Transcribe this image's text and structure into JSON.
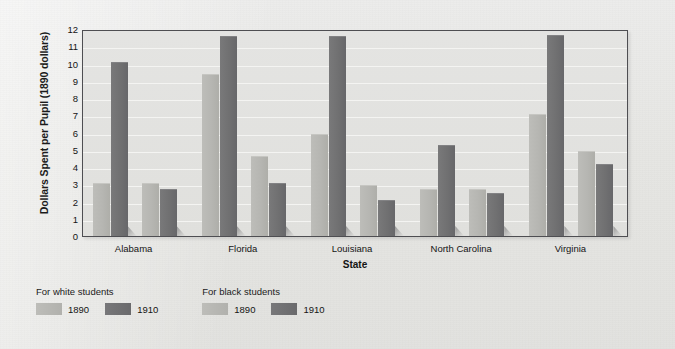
{
  "chart_data": {
    "type": "bar",
    "title": "",
    "xlabel": "State",
    "ylabel": "Dollars Spent per Pupil (1890 dollars)",
    "categories": [
      "Alabama",
      "Florida",
      "Louisiana",
      "North Carolina",
      "Virginia"
    ],
    "series": [
      {
        "name": "For white students 1890",
        "group": "For white students",
        "year": "1890",
        "color": "#b5b5b1",
        "values": [
          3.1,
          9.4,
          5.9,
          2.75,
          7.1
        ]
      },
      {
        "name": "For white students 1910",
        "group": "For white students",
        "year": "1910",
        "color": "#707072",
        "values": [
          10.1,
          11.6,
          11.6,
          5.25,
          11.65
        ]
      },
      {
        "name": "For black students 1890",
        "group": "For black students",
        "year": "1890",
        "color": "#b5b5b1",
        "values": [
          3.05,
          4.65,
          2.95,
          2.7,
          4.95
        ]
      },
      {
        "name": "For black students 1910",
        "group": "For black students",
        "year": "1910",
        "color": "#707072",
        "values": [
          2.7,
          3.1,
          2.1,
          2.5,
          4.15
        ]
      }
    ],
    "ylim": [
      0,
      12
    ],
    "yticks": [
      "0",
      "1",
      "2",
      "3",
      "4",
      "5",
      "6",
      "7",
      "8",
      "9",
      "10",
      "11",
      "12"
    ],
    "grid": true,
    "legend_position": "below-left"
  },
  "legend": {
    "groups": [
      {
        "title": "For white students",
        "entries": [
          {
            "swatch": "light",
            "label": "1890"
          },
          {
            "swatch": "dark",
            "label": "1910"
          }
        ]
      },
      {
        "title": "For black students",
        "entries": [
          {
            "swatch": "light",
            "label": "1890"
          },
          {
            "swatch": "dark",
            "label": "1910"
          }
        ]
      }
    ]
  },
  "colors": {
    "light_bar": "#b5b5b1",
    "dark_bar": "#707072",
    "plot_background": "#e2e2df",
    "gridline": "#f4f4f2",
    "frame": "#4e4e52",
    "page_background": "#e6e6e3",
    "text": "#141414"
  }
}
